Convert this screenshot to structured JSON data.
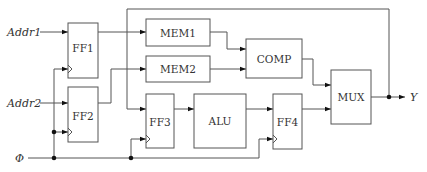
{
  "diagram": {
    "inputs": {
      "addr1": "Addr1",
      "addr2": "Addr2",
      "clock": "Φ"
    },
    "output": "Y",
    "blocks": {
      "ff1": "FF1",
      "ff2": "FF2",
      "ff3": "FF3",
      "ff4": "FF4",
      "mem1": "MEM1",
      "mem2": "MEM2",
      "comp": "COMP",
      "alu": "ALU",
      "mux": "MUX"
    },
    "colors": {
      "line": "#555555",
      "background": "#ffffff",
      "junction": "#111111"
    }
  }
}
